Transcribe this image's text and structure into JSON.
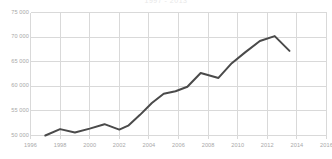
{
  "chart_data": {
    "type": "line",
    "title": "1997 - 2013",
    "xlabel": "",
    "ylabel": "",
    "xlim": [
      1996,
      2016
    ],
    "ylim": [
      50000,
      75000
    ],
    "grid": true,
    "legend": null,
    "legend_position": "none",
    "line_color": "#4a4a4a",
    "grid_color": "#d9d9d9",
    "background_color": "#ffffff",
    "tick_color": "#a8a8a8",
    "xticks": [
      1996,
      1998,
      2000,
      2002,
      2004,
      2006,
      2008,
      2010,
      2012,
      2014,
      2016
    ],
    "xtick_labels": [
      "1996",
      "1998",
      "2000",
      "2002",
      "2004",
      "2006",
      "2008",
      "2010",
      "2012",
      "2014",
      "2016"
    ],
    "yticks": [
      50000,
      55000,
      60000,
      65000,
      70000,
      75000
    ],
    "ytick_labels": [
      "50 000",
      "55 000",
      "60 000",
      "65 000",
      "70 000",
      "75 000"
    ],
    "series": [
      {
        "name": "value",
        "x": [
          1997.0,
          1998.0,
          1999.0,
          2000.0,
          2001.0,
          2002.0,
          2002.6,
          2003.4,
          2004.2,
          2005.0,
          2005.8,
          2006.6,
          2007.5,
          2008.7,
          2009.6,
          2010.5,
          2011.5,
          2012.5,
          2013.5
        ],
        "values": [
          50000,
          51300,
          50600,
          51400,
          52300,
          51200,
          52000,
          54200,
          56600,
          58500,
          59000,
          59900,
          62700,
          61700,
          64700,
          66900,
          69200,
          70200,
          67200
        ]
      }
    ]
  }
}
